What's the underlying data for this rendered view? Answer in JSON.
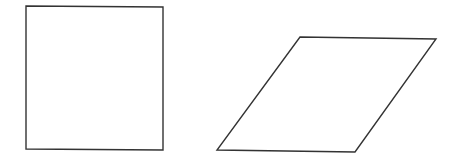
{
  "canvas": {
    "width": 458,
    "height": 165,
    "background": "#ffffff"
  },
  "stroke": {
    "color": "#333333",
    "width": 1.4
  },
  "shapes": [
    {
      "name": "square",
      "type": "polygon",
      "points": "26,6 163,7 163,150 26,149"
    },
    {
      "name": "parallelogram",
      "type": "polygon",
      "points": "300,37 436,39 355,152 217,150"
    }
  ]
}
